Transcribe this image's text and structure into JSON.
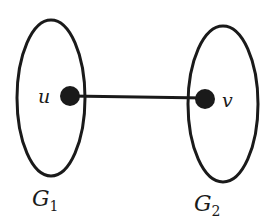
{
  "diagram": {
    "type": "graph",
    "colors": {
      "stroke": "#1a1a1a",
      "node_fill": "#1a1a1a",
      "background": "#ffffff"
    },
    "subgraphs": [
      {
        "id": "G1",
        "label": "G",
        "subscript": "1"
      },
      {
        "id": "G2",
        "label": "G",
        "subscript": "2"
      }
    ],
    "nodes": [
      {
        "id": "u",
        "label": "u",
        "subgraph": "G1"
      },
      {
        "id": "v",
        "label": "v",
        "subgraph": "G2"
      }
    ],
    "edges": [
      {
        "from": "u",
        "to": "v"
      }
    ]
  }
}
